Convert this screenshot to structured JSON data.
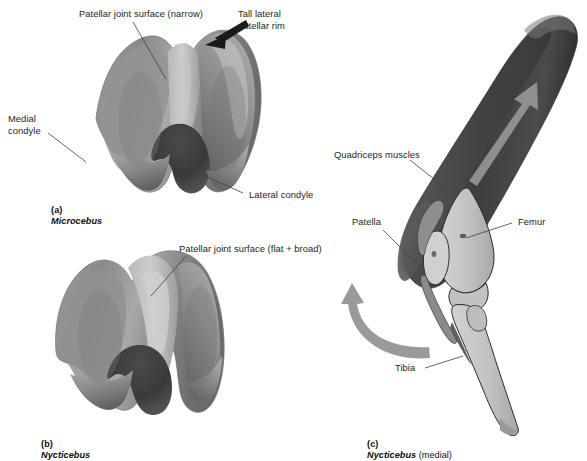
{
  "figure": {
    "kind": "comparative-anatomy-plate",
    "panels": [
      {
        "id": "a",
        "prefix": "(a)",
        "taxon": "Microcebus",
        "suffix": "",
        "caption": "(a) Microcebus",
        "view": "distal femur, anterior view"
      },
      {
        "id": "b",
        "prefix": "(b)",
        "taxon": "Nycticebus",
        "suffix": "",
        "caption": "(b) Nycticebus",
        "view": "distal femur, anterior view"
      },
      {
        "id": "c",
        "prefix": "(c)",
        "taxon": "Nycticebus",
        "suffix": " (medial)",
        "caption": "(c) Nycticebus (medial)",
        "view": "knee joint, medial view"
      }
    ]
  },
  "labels": {
    "patellar_surface_narrow": "Patellar joint surface (narrow)",
    "tall_lateral_rim_line1": "Tall lateral",
    "tall_lateral_rim_line2": "patellar rim",
    "medial_condyle_line1": "Medial",
    "medial_condyle_line2": "condyle",
    "lateral_condyle": "Lateral condyle",
    "patellar_surface_broad": "Patellar joint surface (flat + broad)",
    "quadriceps": "Quadriceps muscles",
    "patella": "Patella",
    "femur": "Femur",
    "tibia": "Tibia"
  },
  "footnote": {
    "text": "clipped caption line — illegible in source image"
  },
  "colors": {
    "text": "#231f20",
    "leader_line": "#3f3f3f",
    "bone_light": "#c9c9c9",
    "bone_mid": "#8e8e8e",
    "bone_dark": "#5d5d5d",
    "bone_shadow": "#474747",
    "cartilage_pale": "#cfcfcf",
    "muscle_dark": "#4a4a4a",
    "muscle_darker": "#343434",
    "bone_outline_line": "#2b2b2b",
    "rotation_arrow": "#9a9a9a",
    "muscle_arrow": "#9c9c9c",
    "pointer_arrow": "#1a1a1a",
    "background": "#ffffff"
  }
}
